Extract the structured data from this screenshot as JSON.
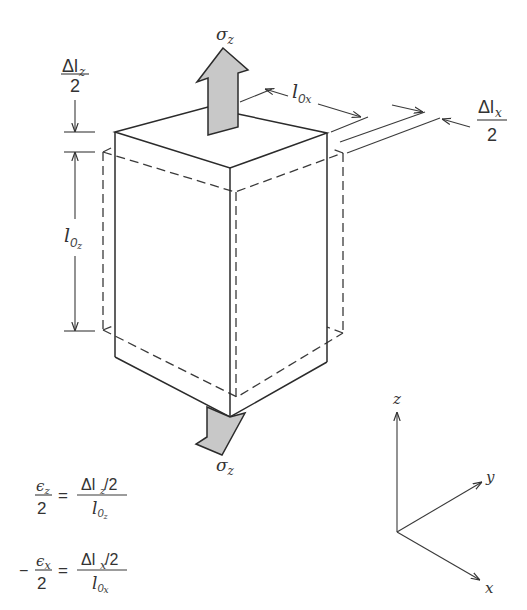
{
  "figure": {
    "colors": {
      "line": "#2b2b2b",
      "arrow_fill": "#c8c8c8",
      "background": "#ffffff"
    },
    "labels": {
      "sigma_top": {
        "base": "σ",
        "sub": "z"
      },
      "sigma_bottom": {
        "base": "σ",
        "sub": "z"
      },
      "delta_lz_half": {
        "num_base": "Δl",
        "num_sub": "z",
        "den": "2"
      },
      "l0z": {
        "base": "l",
        "sub0": "0",
        "sub1": "z"
      },
      "l0x": {
        "base": "l",
        "sub0": "0",
        "sub1": "x"
      },
      "delta_lx_half": {
        "num_base": "Δl",
        "num_sub": "x",
        "den": "2"
      }
    },
    "axes": {
      "z": "z",
      "y": "y",
      "x": "x"
    },
    "equations": [
      {
        "prefix": "",
        "lhs_num_base": "ϵ",
        "lhs_num_sub": "z",
        "lhs_den": "2",
        "equals": "=",
        "rhs_num_base": "Δl",
        "rhs_num_sub": "z",
        "rhs_num_tail": "/2",
        "rhs_den_base": "l",
        "rhs_den_sub0": "0",
        "rhs_den_sub1": "z"
      },
      {
        "prefix": "−",
        "lhs_num_base": "ϵ",
        "lhs_num_sub": "x",
        "lhs_den": "2",
        "equals": "=",
        "rhs_num_base": "Δl",
        "rhs_num_sub": "x",
        "rhs_num_tail": "/2",
        "rhs_den_base": "l",
        "rhs_den_sub0": "0",
        "rhs_den_sub1": "x"
      }
    ]
  }
}
